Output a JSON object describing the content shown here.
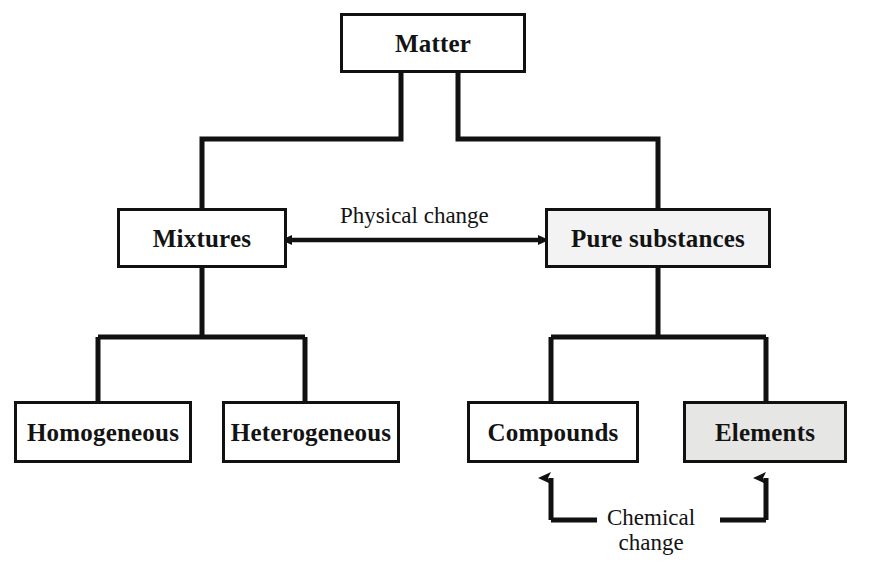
{
  "diagram": {
    "type": "hierarchy-flowchart",
    "background_color": "#ffffff",
    "line_color": "#111111",
    "text_color": "#131313",
    "nodes": [
      {
        "id": "matter",
        "label": "Matter",
        "level": 0,
        "fill": "#ffffff"
      },
      {
        "id": "mixtures",
        "label": "Mixtures",
        "level": 1,
        "fill": "#ffffff"
      },
      {
        "id": "pure-substances",
        "label": "Pure substances",
        "level": 1,
        "fill": "#f3f3f3"
      },
      {
        "id": "homogeneous",
        "label": "Homogeneous",
        "level": 2,
        "fill": "#ffffff"
      },
      {
        "id": "heterogeneous",
        "label": "Heterogeneous",
        "level": 2,
        "fill": "#ffffff"
      },
      {
        "id": "compounds",
        "label": "Compounds",
        "level": 2,
        "fill": "#ffffff"
      },
      {
        "id": "elements",
        "label": "Elements",
        "level": 2,
        "fill": "#e6e6e4"
      }
    ],
    "edge_labels": {
      "physical_change": "Physical change",
      "chemical_change_line1": "Chemical",
      "chemical_change_line2": "change"
    },
    "connections": [
      {
        "from": "matter",
        "to": "mixtures",
        "style": "elbow"
      },
      {
        "from": "matter",
        "to": "pure-substances",
        "style": "elbow"
      },
      {
        "from": "mixtures",
        "to": "homogeneous",
        "style": "tee"
      },
      {
        "from": "mixtures",
        "to": "heterogeneous",
        "style": "tee"
      },
      {
        "from": "pure-substances",
        "to": "compounds",
        "style": "tee"
      },
      {
        "from": "pure-substances",
        "to": "elements",
        "style": "tee"
      },
      {
        "from": "mixtures",
        "to": "pure-substances",
        "style": "double-arrow",
        "label": "Physical change"
      },
      {
        "from": "compounds",
        "to": "elements",
        "style": "double-arrow-up",
        "label": "Chemical change"
      }
    ]
  }
}
